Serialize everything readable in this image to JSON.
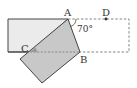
{
  "figure": {
    "type": "folded-rectangle-geometry",
    "points": {
      "A": {
        "label": "A",
        "x": 68,
        "y": 19
      },
      "B": {
        "label": "B",
        "x": 80,
        "y": 52
      },
      "C": {
        "label": "C",
        "x": 30,
        "y": 52
      },
      "D": {
        "label": "D",
        "x": 106,
        "y": 19
      }
    },
    "angle_label": "70°",
    "colors": {
      "stroke": "#444444",
      "unfolded_fill": "#ebebeb",
      "flap_fill": "#c8c8c8",
      "overlap_shade": "#9a9a9a",
      "dashed": "#777777"
    }
  }
}
